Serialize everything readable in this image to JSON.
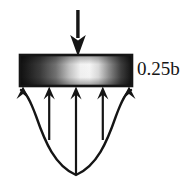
{
  "figure": {
    "background_color": "#ffffff",
    "ink_color": "#151515",
    "dimension_label": "0.25b",
    "plate": {
      "name": "bearing-plate",
      "x": 20,
      "y": 55,
      "width": 112,
      "height": 31,
      "border_color": "#151515",
      "gradient_stops": [
        "#1a1a1a",
        "#4a4a4a",
        "#f5f5f5",
        "#ffffff",
        "#e8e8e8",
        "#555555",
        "#151515"
      ]
    },
    "load_arrow": {
      "name": "applied-load-arrow",
      "direction": "down",
      "x": 78,
      "y_start": 10,
      "y_end": 55,
      "color": "#151515"
    },
    "reaction_arrows": [
      {
        "name": "reaction-arrow-1",
        "x": 23,
        "length": 0,
        "direction": "up"
      },
      {
        "name": "reaction-arrow-2",
        "x": 49,
        "length": 54,
        "direction": "up"
      },
      {
        "name": "reaction-arrow-3",
        "x": 76,
        "length": 89,
        "direction": "up"
      },
      {
        "name": "reaction-arrow-4",
        "x": 103,
        "length": 54,
        "direction": "up"
      },
      {
        "name": "reaction-arrow-5",
        "x": 129,
        "length": 0,
        "direction": "up"
      }
    ],
    "pressure_curve": {
      "name": "pressure-distribution-curve",
      "type": "parabolic",
      "left_x": 20,
      "right_x": 132,
      "top_y": 90,
      "bottom_y": 175,
      "color": "#151515"
    }
  }
}
